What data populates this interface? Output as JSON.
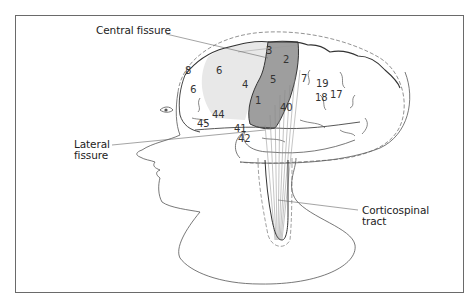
{
  "figure": {
    "colors": {
      "motor_cortex_area4": "#9a9a9a",
      "premotor_area6": "#e6e6e6",
      "outline": "#333333",
      "background": "#ffffff"
    }
  },
  "labels": {
    "central_fissure": "Central fissure",
    "lateral_fissure_line1": "Lateral",
    "lateral_fissure_line2": "fissure",
    "corticospinal_line1": "Corticospinal",
    "corticospinal_line2": "tract"
  },
  "brodmann_areas": {
    "a8": "8",
    "a6": "6",
    "a9": "9",
    "a4": "4",
    "a3": "3",
    "a2": "2",
    "a1": "1",
    "a5": "5",
    "a7": "7",
    "a19": "19",
    "a18": "18",
    "a17": "17",
    "a40": "40",
    "a44": "44",
    "a45": "45",
    "a41": "41",
    "a42": "42"
  }
}
